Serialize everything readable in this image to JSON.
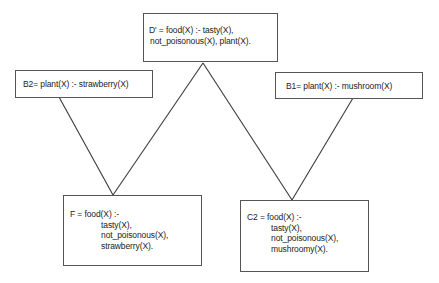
{
  "diagram": {
    "type": "lattice / generalization diagram",
    "nodes": [
      {
        "id": "D",
        "label": "D' = food(X) :- tasty(X),",
        "lines": [
          "D' = food(X) :- tasty(X),",
          "not_poisonous(X), plant(X)."
        ]
      },
      {
        "id": "B2",
        "lines": [
          "B2= plant(X) :- strawberry(X)"
        ]
      },
      {
        "id": "B1",
        "lines": [
          "B1= plant(X) :- mushroom(X)"
        ]
      },
      {
        "id": "F",
        "lines": [
          "F = food(X) :-",
          "tasty(X),",
          "not_poisonous(X),",
          "strawberry(X)."
        ]
      },
      {
        "id": "C2",
        "lines": [
          "C2 = food(X) :-",
          "tasty(X),",
          "not_poisonous(X),",
          "mushroomy(X)."
        ]
      }
    ],
    "edges": [
      {
        "from": "B2",
        "to": "F"
      },
      {
        "from": "D",
        "to": "F"
      },
      {
        "from": "D",
        "to": "C2"
      },
      {
        "from": "B1",
        "to": "C2"
      }
    ],
    "colors": {
      "line": "#3a3a3a",
      "box_border": "#555555",
      "background": "#ffffff",
      "text": "#222222"
    }
  }
}
